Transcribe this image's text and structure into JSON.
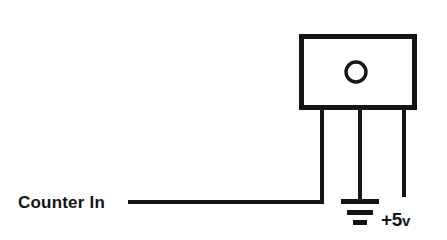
{
  "diagram": {
    "background_color": "#ffffff",
    "ink_color": "#151515",
    "labels": {
      "counter_in": "Counter In",
      "supply": "+5",
      "supply_unit": "v"
    },
    "component": {
      "name": "sensor-module",
      "shape": "rectangle",
      "x": 299,
      "y": 34,
      "width": 118,
      "height": 76,
      "stroke_width": 5,
      "marker": {
        "name": "lens-circle",
        "cx": 356,
        "cy": 72,
        "r": 10,
        "stroke_width": 3
      }
    },
    "pins": [
      {
        "name": "signal-pin",
        "x": 322,
        "y_top": 110,
        "y_bottom": 202
      },
      {
        "name": "ground-pin",
        "x": 360,
        "y_top": 110,
        "y_bottom": 201
      },
      {
        "name": "supply-pin",
        "x": 404,
        "y_top": 110,
        "y_bottom": 197
      }
    ],
    "signal_wire": {
      "name": "counter-in-wire",
      "x_start": 128,
      "x_end": 322,
      "y": 202,
      "stroke_width": 4
    },
    "ground_symbol": {
      "name": "ground-symbol",
      "cx": 360,
      "bars": [
        {
          "y": 201,
          "half_width": 19,
          "thickness": 5
        },
        {
          "y": 212,
          "half_width": 13,
          "thickness": 5
        },
        {
          "y": 222,
          "half_width": 7,
          "thickness": 5
        }
      ]
    },
    "text_positions": {
      "counter_in_x": 18,
      "counter_in_y": 208,
      "supply_x": 381,
      "supply_y": 226
    }
  }
}
